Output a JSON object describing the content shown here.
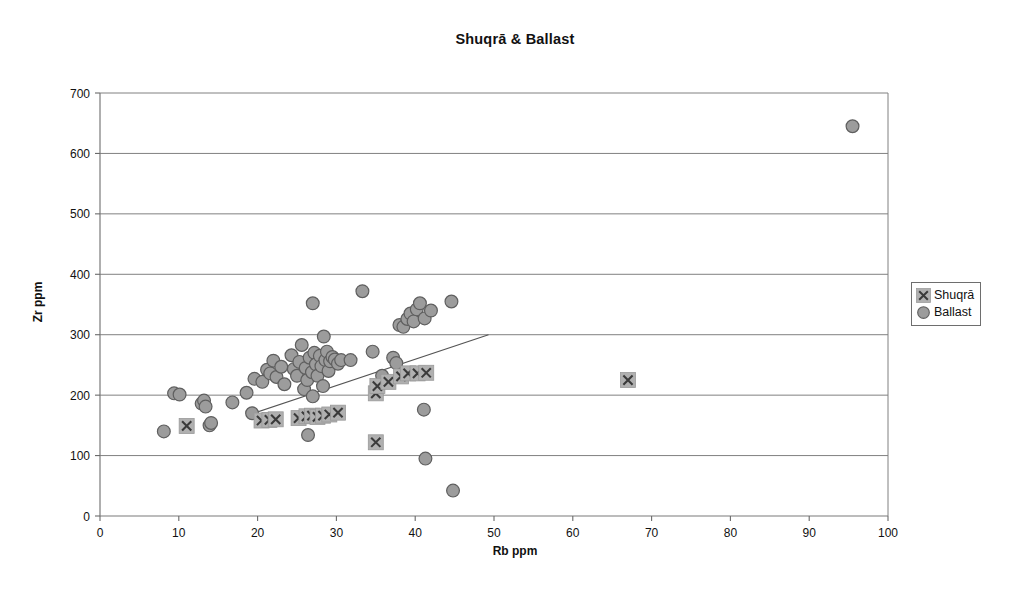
{
  "chart_data": {
    "type": "scatter",
    "title": "Shuqrā & Ballast",
    "xlabel": "Rb ppm",
    "ylabel": "Zr ppm",
    "xlim": [
      0,
      100
    ],
    "ylim": [
      0,
      700
    ],
    "xticks": [
      0,
      10,
      20,
      30,
      40,
      50,
      60,
      70,
      80,
      90,
      100
    ],
    "yticks": [
      0,
      100,
      200,
      300,
      400,
      500,
      600,
      700
    ],
    "grid": "horizontal",
    "legend_position": "right",
    "series": [
      {
        "name": "Shuqrā",
        "marker": "x-in-square",
        "color": "#8f8f8f",
        "points": [
          [
            11.0,
            149
          ],
          [
            20.5,
            158
          ],
          [
            21.5,
            159
          ],
          [
            22.3,
            160
          ],
          [
            25.2,
            162
          ],
          [
            26.2,
            165
          ],
          [
            26.9,
            166
          ],
          [
            27.6,
            164
          ],
          [
            28.3,
            166
          ],
          [
            29.1,
            168
          ],
          [
            30.2,
            171
          ],
          [
            35.0,
            203
          ],
          [
            35.2,
            215
          ],
          [
            36.6,
            222
          ],
          [
            38.2,
            231
          ],
          [
            39.1,
            236
          ],
          [
            40.3,
            236
          ],
          [
            41.4,
            237
          ],
          [
            35.0,
            122
          ],
          [
            67.0,
            225
          ]
        ]
      },
      {
        "name": "Ballast",
        "marker": "circle",
        "color": "#8f8f8f",
        "points": [
          [
            8.1,
            140
          ],
          [
            9.4,
            203
          ],
          [
            10.1,
            201
          ],
          [
            12.9,
            186
          ],
          [
            13.2,
            191
          ],
          [
            13.4,
            181
          ],
          [
            13.9,
            150
          ],
          [
            14.1,
            154
          ],
          [
            16.8,
            188
          ],
          [
            18.6,
            204
          ],
          [
            19.3,
            170
          ],
          [
            19.6,
            227
          ],
          [
            20.6,
            222
          ],
          [
            21.2,
            242
          ],
          [
            21.6,
            236
          ],
          [
            22.0,
            257
          ],
          [
            22.4,
            230
          ],
          [
            23.0,
            247
          ],
          [
            23.4,
            218
          ],
          [
            24.3,
            266
          ],
          [
            24.6,
            243
          ],
          [
            25.0,
            232
          ],
          [
            25.3,
            255
          ],
          [
            25.6,
            283
          ],
          [
            25.9,
            210
          ],
          [
            26.1,
            245
          ],
          [
            26.3,
            225
          ],
          [
            26.6,
            262
          ],
          [
            26.9,
            238
          ],
          [
            27.0,
            198
          ],
          [
            27.2,
            270
          ],
          [
            27.4,
            251
          ],
          [
            27.6,
            232
          ],
          [
            27.9,
            265
          ],
          [
            28.1,
            248
          ],
          [
            28.3,
            215
          ],
          [
            28.4,
            297
          ],
          [
            28.6,
            258
          ],
          [
            28.8,
            272
          ],
          [
            29.0,
            240
          ],
          [
            29.2,
            256
          ],
          [
            29.5,
            263
          ],
          [
            29.8,
            259
          ],
          [
            30.2,
            252
          ],
          [
            30.6,
            258
          ],
          [
            26.4,
            134
          ],
          [
            27.0,
            352
          ],
          [
            31.8,
            258
          ],
          [
            33.3,
            372
          ],
          [
            34.6,
            272
          ],
          [
            35.8,
            232
          ],
          [
            37.2,
            262
          ],
          [
            37.6,
            253
          ],
          [
            38.0,
            316
          ],
          [
            38.5,
            313
          ],
          [
            39.0,
            326
          ],
          [
            39.4,
            335
          ],
          [
            39.8,
            322
          ],
          [
            40.2,
            342
          ],
          [
            40.6,
            352
          ],
          [
            41.2,
            327
          ],
          [
            42.0,
            340
          ],
          [
            44.6,
            355
          ],
          [
            41.1,
            176
          ],
          [
            41.3,
            95
          ],
          [
            44.8,
            42
          ],
          [
            95.5,
            645
          ]
        ]
      }
    ],
    "trendline": {
      "label": "linear-fit",
      "x1": 19.0,
      "y1": 168,
      "x2": 49.3,
      "y2": 300
    }
  }
}
